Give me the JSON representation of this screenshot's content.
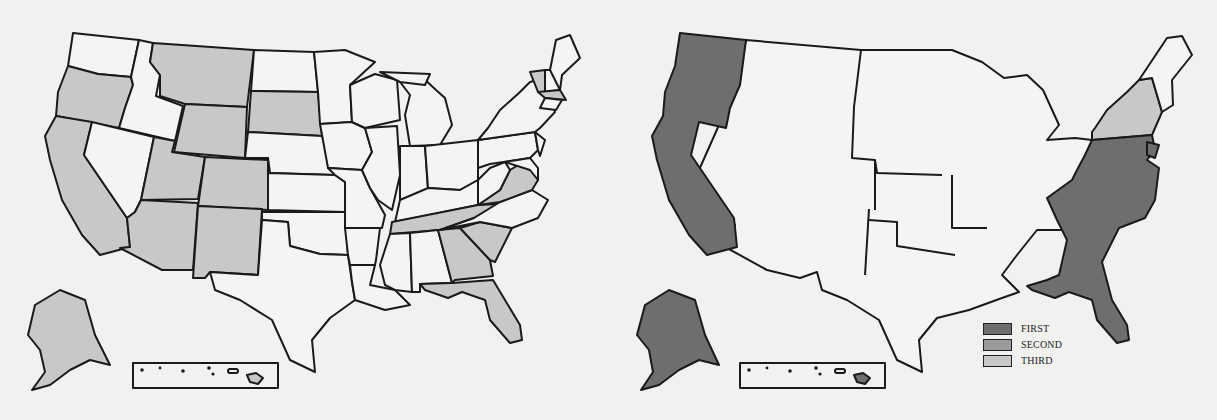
{
  "colors": {
    "background": "#f1f1ef",
    "outline": "#1a1a1a",
    "unfilled": "#f4f4f2",
    "first": "#6e6e6e",
    "second": "#9a9a9a",
    "third": "#c8c8c8"
  },
  "maps": [
    {
      "id": "left",
      "description": "United States map with selected states shaded light gray",
      "shaded_states": [
        "Washington-adjacent Oregon",
        "California",
        "Montana",
        "Wyoming",
        "South Dakota",
        "Utah",
        "Colorado",
        "Arizona",
        "New Mexico",
        "Alaska",
        "Virginia",
        "Tennessee",
        "Georgia",
        "South Carolina",
        "Florida",
        "Vermont",
        "Massachusetts",
        "Hawaii"
      ],
      "inset": "hawaii-inset"
    },
    {
      "id": "right",
      "description": "United States map with regional shading by rank",
      "regions": [
        {
          "name": "Pacific coast (WA, OR, CA)",
          "rank": "FIRST"
        },
        {
          "name": "Alaska",
          "rank": "FIRST"
        },
        {
          "name": "Atlantic seaboard / Southeast",
          "rank": "FIRST"
        },
        {
          "name": "New York / upper Northeast",
          "rank": "THIRD"
        }
      ],
      "inset": "hawaii-inset"
    }
  ],
  "legend": {
    "items": [
      {
        "label": "FIRST",
        "color": "#6e6e6e"
      },
      {
        "label": "SECOND",
        "color": "#9a9a9a"
      },
      {
        "label": "THIRD",
        "color": "#c8c8c8"
      }
    ]
  }
}
